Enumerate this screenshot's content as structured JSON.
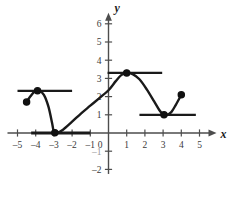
{
  "figure": {
    "axis_labels": {
      "x": "x",
      "y": "y"
    },
    "x_ticks": [
      {
        "value": -5,
        "label": "–5"
      },
      {
        "value": -4,
        "label": "–4"
      },
      {
        "value": -3,
        "label": "–3"
      },
      {
        "value": -2,
        "label": "–2"
      },
      {
        "value": -1,
        "label": "–1"
      },
      {
        "value": 0,
        "label": "0"
      },
      {
        "value": 1,
        "label": "1"
      },
      {
        "value": 2,
        "label": "2"
      },
      {
        "value": 3,
        "label": "3"
      },
      {
        "value": 4,
        "label": "4"
      },
      {
        "value": 5,
        "label": "5"
      }
    ],
    "y_ticks": [
      {
        "value": 6,
        "label": "6"
      },
      {
        "value": 5,
        "label": "5"
      },
      {
        "value": 4,
        "label": "4"
      },
      {
        "value": 3,
        "label": "3"
      },
      {
        "value": 2,
        "label": "2"
      },
      {
        "value": 1,
        "label": "1"
      },
      {
        "value": -1,
        "label": "–1"
      },
      {
        "value": -2,
        "label": "–2"
      }
    ],
    "colors": {
      "curve": "#1a1a1a",
      "axis": "#4d4d4d",
      "tangent": "#1a1a1a",
      "point": "#111111",
      "background": "#ffffff"
    }
  },
  "chart_data": {
    "type": "line",
    "title": "",
    "xlabel": "x",
    "ylabel": "y",
    "xlim": [
      -5.6,
      5.8
    ],
    "ylim": [
      -2.4,
      6.6
    ],
    "grid": false,
    "legend": null,
    "series": [
      {
        "name": "curve",
        "description": "Piecewise smooth curve with horizontal tangents at the turning points",
        "points": [
          {
            "x": -4.5,
            "y": 1.7
          },
          {
            "x": -4.3,
            "y": 2.0
          },
          {
            "x": -4.05,
            "y": 2.28
          },
          {
            "x": -3.8,
            "y": 2.32
          },
          {
            "x": -3.55,
            "y": 2.1
          },
          {
            "x": -3.3,
            "y": 1.45
          },
          {
            "x": -3.1,
            "y": 0.55
          },
          {
            "x": -3.0,
            "y": 0.05
          },
          {
            "x": -2.85,
            "y": 0.0
          },
          {
            "x": -2.5,
            "y": 0.18
          },
          {
            "x": -2.0,
            "y": 0.62
          },
          {
            "x": -1.5,
            "y": 1.08
          },
          {
            "x": -1.0,
            "y": 1.5
          },
          {
            "x": -0.5,
            "y": 1.92
          },
          {
            "x": 0.0,
            "y": 2.35
          },
          {
            "x": 0.4,
            "y": 2.85
          },
          {
            "x": 0.7,
            "y": 3.18
          },
          {
            "x": 1.0,
            "y": 3.3
          },
          {
            "x": 1.35,
            "y": 3.22
          },
          {
            "x": 1.7,
            "y": 2.95
          },
          {
            "x": 2.1,
            "y": 2.4
          },
          {
            "x": 2.5,
            "y": 1.75
          },
          {
            "x": 2.8,
            "y": 1.25
          },
          {
            "x": 3.0,
            "y": 1.02
          },
          {
            "x": 3.2,
            "y": 1.0
          },
          {
            "x": 3.45,
            "y": 1.15
          },
          {
            "x": 3.7,
            "y": 1.55
          },
          {
            "x": 4.0,
            "y": 2.1
          }
        ]
      }
    ],
    "tangent_lines": [
      {
        "name": "tangent-upper-left",
        "y": 2.32,
        "x_start": -5.0,
        "x_end": -2.0
      },
      {
        "name": "tangent-x-axis",
        "y": 0.0,
        "x_start": -4.25,
        "x_end": -1.0
      },
      {
        "name": "tangent-upper-right",
        "y": 3.3,
        "x_start": -0.05,
        "x_end": 2.95
      },
      {
        "name": "tangent-lower-right",
        "y": 1.0,
        "x_start": 1.7,
        "x_end": 4.8
      }
    ],
    "marked_points": [
      {
        "name": "endpoint-left",
        "x": -4.5,
        "y": 1.7,
        "filled": true
      },
      {
        "name": "local-max-left",
        "x": -3.9,
        "y": 2.32,
        "filled": true
      },
      {
        "name": "local-min-left",
        "x": -2.95,
        "y": 0.02,
        "filled": true
      },
      {
        "name": "local-max-right",
        "x": 1.0,
        "y": 3.3,
        "filled": true
      },
      {
        "name": "local-min-right",
        "x": 3.05,
        "y": 1.0,
        "filled": true
      },
      {
        "name": "endpoint-right",
        "x": 4.0,
        "y": 2.1,
        "filled": true
      }
    ]
  }
}
